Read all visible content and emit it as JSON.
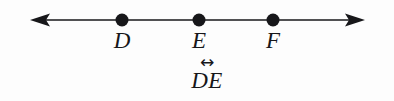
{
  "figure": {
    "type": "geometry-line-diagram",
    "background_color": "#fdfdfd",
    "ink_color": "#17171a",
    "line": {
      "name": "horizontal-line-with-arrowheads",
      "y": 20,
      "x_start": 30,
      "x_end": 365,
      "stroke_width": 1.6,
      "left_arrowhead": true,
      "right_arrowhead": true
    },
    "points": [
      {
        "id": "D",
        "label": "D",
        "cx": 122,
        "cy": 20,
        "r": 6.5
      },
      {
        "id": "E",
        "label": "E",
        "cx": 199,
        "cy": 20,
        "r": 6.5
      },
      {
        "id": "F",
        "label": "F",
        "cx": 273,
        "cy": 20,
        "r": 6.5
      }
    ],
    "notation": {
      "arrow_glyph": "↔",
      "text": "DE",
      "meaning_label": "line-DE"
    }
  }
}
